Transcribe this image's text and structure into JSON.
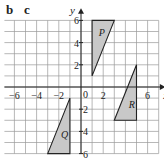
{
  "labels": {
    "b": "b",
    "c": "c"
  },
  "axes": {
    "x_label": "x",
    "y_label": "y",
    "x_ticks": [
      {
        "v": -6,
        "t": "−6"
      },
      {
        "v": -4,
        "t": "−4"
      },
      {
        "v": -2,
        "t": "−2"
      },
      {
        "v": 2,
        "t": "2"
      },
      {
        "v": 6,
        "t": "6"
      }
    ],
    "y_ticks": [
      {
        "v": 6,
        "t": "6"
      },
      {
        "v": 4,
        "t": "4"
      },
      {
        "v": 2,
        "t": "2"
      },
      {
        "v": -2,
        "t": "2"
      },
      {
        "v": -4,
        "t": "4"
      },
      {
        "v": -6,
        "t": "6"
      }
    ],
    "origin": "0",
    "xlim": [
      -7,
      7
    ],
    "ylim": [
      -6,
      6
    ]
  },
  "shapes": [
    {
      "name": "P",
      "points": [
        [
          1,
          6
        ],
        [
          3,
          6
        ],
        [
          1,
          1
        ]
      ],
      "label_at": [
        1.6,
        4.6
      ]
    },
    {
      "name": "R",
      "points": [
        [
          5,
          2
        ],
        [
          5,
          -3
        ],
        [
          3,
          -3
        ]
      ],
      "label_at": [
        4.3,
        -1.9
      ]
    },
    {
      "name": "Q",
      "points": [
        [
          -1,
          -1
        ],
        [
          -1,
          -6
        ],
        [
          -3,
          -6
        ]
      ],
      "label_at": [
        -1.8,
        -4.6
      ]
    }
  ],
  "colors": {
    "grid": "#9a9a9a",
    "axis": "#222222",
    "fill": "#c8c8c8",
    "stroke": "#222222"
  }
}
